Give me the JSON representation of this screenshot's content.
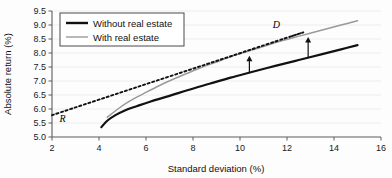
{
  "chart_data": {
    "type": "line",
    "title": "",
    "xlabel": "Standard deviation (%)",
    "ylabel": "Absolute return (%)",
    "xlim": [
      2,
      16
    ],
    "ylim": [
      5.0,
      9.5
    ],
    "xticks": [
      "2",
      "4",
      "6",
      "8",
      "10",
      "12",
      "14",
      "16"
    ],
    "yticks": [
      "5.0",
      "5.5",
      "6.0",
      "6.5",
      "7.0",
      "7.5",
      "8.0",
      "8.5",
      "9.0",
      "9.5"
    ],
    "grid": "horizontal",
    "legend_position": "top-left",
    "series": [
      {
        "name": "Without real estate",
        "style": "solid-black",
        "points": [
          [
            4.1,
            5.35
          ],
          [
            4.35,
            5.58
          ],
          [
            4.7,
            5.78
          ],
          [
            5.1,
            5.95
          ],
          [
            5.6,
            6.1
          ],
          [
            6.2,
            6.27
          ],
          [
            7.0,
            6.47
          ],
          [
            7.8,
            6.68
          ],
          [
            8.7,
            6.9
          ],
          [
            9.6,
            7.12
          ],
          [
            10.5,
            7.32
          ],
          [
            11.5,
            7.54
          ],
          [
            12.5,
            7.75
          ],
          [
            13.5,
            7.96
          ],
          [
            14.3,
            8.13
          ],
          [
            15.0,
            8.28
          ]
        ]
      },
      {
        "name": "With real estate",
        "style": "solid-gray",
        "points": [
          [
            4.35,
            5.7
          ],
          [
            4.8,
            6.0
          ],
          [
            5.3,
            6.28
          ],
          [
            5.9,
            6.55
          ],
          [
            6.6,
            6.85
          ],
          [
            7.4,
            7.15
          ],
          [
            8.2,
            7.43
          ],
          [
            9.0,
            7.68
          ],
          [
            9.9,
            7.95
          ],
          [
            10.8,
            8.18
          ],
          [
            11.7,
            8.42
          ],
          [
            12.6,
            8.62
          ],
          [
            13.5,
            8.82
          ],
          [
            14.3,
            9.0
          ],
          [
            15.0,
            9.15
          ]
        ]
      },
      {
        "name": "Capital market line",
        "style": "dashed-black",
        "points": [
          [
            2.0,
            5.78
          ],
          [
            11.9,
            8.52
          ],
          [
            12.1,
            8.57
          ]
        ]
      }
    ],
    "annotations": [
      {
        "label": "R",
        "x": 2.45,
        "y": 5.52,
        "note": "risk-free rate intercept"
      },
      {
        "label": "D",
        "x": 11.55,
        "y": 8.88,
        "note": "tangency portfolio"
      }
    ],
    "arrows": [
      {
        "x": 10.4,
        "y_from": 7.3,
        "y_to": 7.9,
        "direction": "up"
      },
      {
        "x": 12.9,
        "y_from": 7.82,
        "y_to": 8.57,
        "direction": "up"
      }
    ]
  },
  "legend": {
    "items": [
      {
        "label": "Without real estate",
        "swatch": "black-thick-line"
      },
      {
        "label": "With real estate",
        "swatch": "gray-thin-line"
      }
    ]
  },
  "colors": {
    "curve_black": "#111111",
    "curve_gray": "#9a9a9a",
    "gridline": "#e9e9ec",
    "axis": "#5c5c5c",
    "background": "#fdfdfd"
  }
}
